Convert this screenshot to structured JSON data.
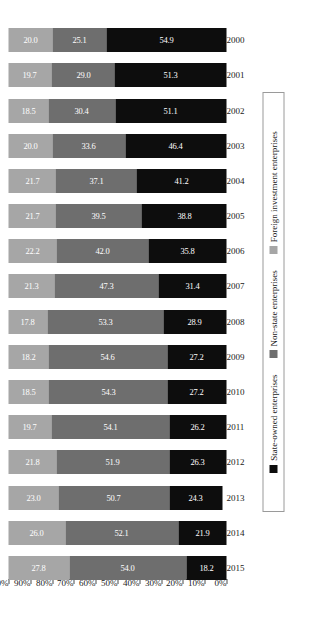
{
  "chart_data": {
    "type": "bar",
    "subtype": "100% stacked bar",
    "orientation": "vertical-bars-rotated",
    "title": "",
    "xlabel": "",
    "ylabel": "",
    "ylim": [
      0,
      100
    ],
    "grid": false,
    "legend_position": "bottom",
    "value_labels": true,
    "categories": [
      "2000",
      "2001",
      "2002",
      "2003",
      "2004",
      "2005",
      "2006",
      "2007",
      "2008",
      "2009",
      "2010",
      "2011",
      "2012",
      "2013",
      "2014",
      "2015"
    ],
    "ytick_labels": [
      "100%",
      "90%",
      "80%",
      "70%",
      "60%",
      "50%",
      "40%",
      "30%",
      "20%",
      "10%",
      "0%"
    ],
    "ytick_values": [
      100,
      90,
      80,
      70,
      60,
      50,
      40,
      30,
      20,
      10,
      0
    ],
    "series": [
      {
        "name": "Foreign investment enterprises",
        "color": "#a6a6a6",
        "values": [
          20.0,
          19.7,
          18.5,
          20.0,
          21.7,
          21.7,
          22.2,
          21.3,
          17.8,
          18.2,
          18.5,
          19.7,
          21.8,
          23.0,
          26.0,
          27.8
        ],
        "labels": [
          "20.0",
          "19.7",
          "18.5",
          "20.0",
          "21.7",
          "21.7",
          "22.2",
          "21.3",
          "17.8",
          "18.2",
          "18.5",
          "19.7",
          "21.8",
          "23.0",
          "26.0",
          "27.8"
        ]
      },
      {
        "name": "Non-state enterprises",
        "color": "#6e6e6e",
        "values": [
          25.1,
          29.0,
          30.4,
          33.6,
          37.1,
          39.5,
          42.0,
          47.3,
          53.3,
          54.6,
          54.3,
          54.1,
          51.9,
          50.7,
          52.1,
          54.0
        ],
        "labels": [
          "25.1",
          "29.0",
          "30.4",
          "33.6",
          "37.1",
          "39.5",
          "42.0",
          "47.3",
          "53.3",
          "54.6",
          "54.3",
          "54.1",
          "51.9",
          "50.7",
          "52.1",
          "54.0"
        ]
      },
      {
        "name": "State-owned enterprises",
        "color": "#0d0d0d",
        "values": [
          54.9,
          51.3,
          51.1,
          46.4,
          41.2,
          38.8,
          35.8,
          31.4,
          28.9,
          27.2,
          27.2,
          26.2,
          26.3,
          24.3,
          21.9,
          18.2
        ],
        "labels": [
          "54.9",
          "51.3",
          "51.1",
          "46.4",
          "41.2",
          "38.8",
          "35.8",
          "31.4",
          "28.9",
          "27.2",
          "27.2",
          "26.2",
          "26.3",
          "24.3",
          "21.9",
          "18.2"
        ]
      }
    ]
  },
  "legend": {
    "items": [
      {
        "label": "State-owned enterprises",
        "swatch": "state"
      },
      {
        "label": "Non-state enterprises",
        "swatch": "nonstate"
      },
      {
        "label": "Foreign investment enterprises",
        "swatch": "foreign"
      }
    ]
  }
}
